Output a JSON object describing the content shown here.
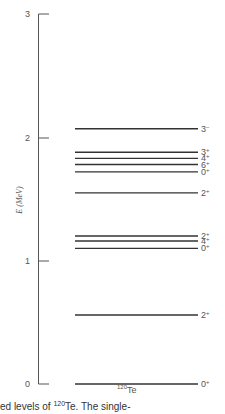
{
  "chart_data": {
    "type": "level-diagram",
    "title": "",
    "ylabel": "E (MeV)",
    "ylim": [
      0,
      3
    ],
    "yticks": [
      0,
      1,
      2,
      3
    ],
    "nuclide": "120Te",
    "nuclide_mass": "120",
    "nuclide_symbol": "Te",
    "levels": [
      {
        "energy_mev": 0.0,
        "jpi": "0+"
      },
      {
        "energy_mev": 0.56,
        "jpi": "2+"
      },
      {
        "energy_mev": 1.1,
        "jpi": "0+"
      },
      {
        "energy_mev": 1.16,
        "jpi": "4+"
      },
      {
        "energy_mev": 1.2,
        "jpi": "2+"
      },
      {
        "energy_mev": 1.55,
        "jpi": "2+"
      },
      {
        "energy_mev": 1.72,
        "jpi": "0+"
      },
      {
        "energy_mev": 1.78,
        "jpi": "6+"
      },
      {
        "energy_mev": 1.83,
        "jpi": "4+"
      },
      {
        "energy_mev": 1.88,
        "jpi": "3+"
      },
      {
        "energy_mev": 2.07,
        "jpi": "3-"
      }
    ]
  },
  "axis": {
    "title": "E (MeV)",
    "ticks": [
      "0",
      "1",
      "2",
      "3"
    ]
  },
  "labels": {
    "nuclide_mass": "120",
    "nuclide_symbol": "Te",
    "caption_partial": "ed levels of ",
    "caption_mass": "120",
    "caption_symbol": "Te. The single-"
  }
}
